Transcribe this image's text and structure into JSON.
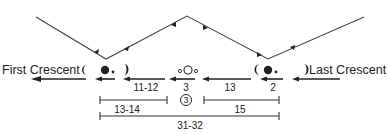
{
  "labels": {
    "first_crescent": "First Crescent",
    "last_crescent": "Last Crescent"
  },
  "intervals": {
    "left_arrow": "11-12",
    "center_arrow": "3",
    "right_arrow": "13",
    "far_right_arrow": "2",
    "left_bracket": "13-14",
    "center_circled": "3",
    "right_bracket": "15",
    "total_bracket": "31-32"
  },
  "colors": {
    "ink": "#222222",
    "background": "#ffffff"
  }
}
